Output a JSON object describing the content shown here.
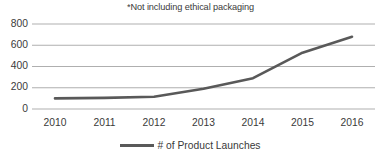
{
  "chart_data": {
    "type": "line",
    "title": "*Not including ethical packaging",
    "xlabel": "",
    "ylabel": "",
    "categories": [
      "2010",
      "2011",
      "2012",
      "2013",
      "2014",
      "2015",
      "2016"
    ],
    "series": [
      {
        "name": "# of Product Launches",
        "values": [
          100,
          105,
          115,
          190,
          290,
          530,
          680
        ],
        "color": "#595959"
      }
    ],
    "ylim": [
      0,
      800
    ],
    "yticks": [
      0,
      200,
      400,
      600,
      800
    ],
    "ytick_labels": [
      "0",
      "200",
      "400",
      "600",
      "800"
    ],
    "grid": true,
    "grid_color": "#a6a6a6",
    "legend_position": "bottom",
    "legend_entries": [
      "# of Product Launches"
    ]
  },
  "legend": {
    "swatch_name": "line-swatch",
    "label": "# of Product Launches"
  },
  "axis": {
    "y_labels": [
      "800",
      "600",
      "400",
      "200",
      "0"
    ],
    "x_labels": [
      "2010",
      "2011",
      "2012",
      "2013",
      "2014",
      "2015",
      "2016"
    ]
  }
}
